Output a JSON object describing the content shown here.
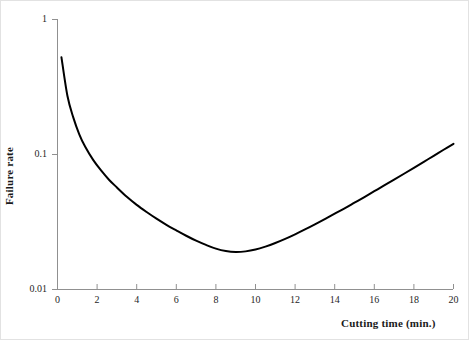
{
  "chart_data": {
    "type": "line",
    "title": "",
    "subtitle": "",
    "xlabel": "Cutting time (min.)",
    "ylabel": "Failure rate",
    "xlim": [
      0,
      20
    ],
    "ylim": [
      0.01,
      1
    ],
    "yscale": "log",
    "xscale": "linear",
    "grid": false,
    "legend": null,
    "xticks": [
      0,
      2,
      4,
      6,
      8,
      10,
      12,
      14,
      16,
      18,
      20
    ],
    "xtick_labels": [
      "0",
      "2",
      "4",
      "6",
      "8",
      "10",
      "12",
      "14",
      "16",
      "18",
      "20"
    ],
    "yticks": [
      0.01,
      0.1,
      1
    ],
    "ytick_labels": [
      "0.01",
      "0.1",
      "1"
    ],
    "series": [
      {
        "name": "Failure rate",
        "line_color": "#000000",
        "line_width": 2,
        "markers": false,
        "x": [
          0.2,
          0.5,
          0.8,
          1.1,
          1.4,
          1.8,
          2.2,
          2.6,
          3.0,
          3.5,
          4.0,
          4.5,
          5.0,
          5.5,
          6.0,
          6.5,
          7.0,
          7.5,
          8.0,
          8.5,
          9.0,
          9.5,
          10.0,
          10.5,
          11.0,
          11.5,
          12.0,
          12.5,
          13.0,
          13.5,
          14.0,
          14.5,
          15.0,
          15.5,
          16.0,
          16.5,
          17.0,
          17.5,
          18.0,
          18.5,
          19.0,
          19.5,
          20.0
        ],
        "y": [
          0.52,
          0.27,
          0.186,
          0.14,
          0.113,
          0.0905,
          0.0755,
          0.0645,
          0.0565,
          0.0482,
          0.042,
          0.0372,
          0.0332,
          0.0299,
          0.0272,
          0.0248,
          0.0228,
          0.0212,
          0.0199,
          0.0191,
          0.0188,
          0.019,
          0.0196,
          0.0206,
          0.0219,
          0.0235,
          0.0254,
          0.0276,
          0.0301,
          0.0329,
          0.0361,
          0.0396,
          0.0436,
          0.048,
          0.053,
          0.0585,
          0.0646,
          0.0714,
          0.079,
          0.0875,
          0.0969,
          0.1075,
          0.119
        ]
      }
    ],
    "annotations": []
  },
  "axes": {
    "y_title": "Failure rate",
    "x_title": "Cutting time (min.)",
    "axis_color": "#808080",
    "curve_color": "#000000",
    "tick_text_color": "#262626"
  }
}
